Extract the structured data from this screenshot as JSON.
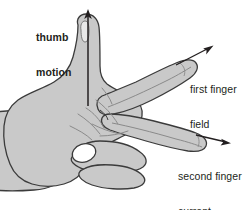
{
  "diagram": {
    "background_color": "#ffffff",
    "hand_fill_color": "#c9c9c9",
    "hand_outline_color": "#3b3b3b",
    "crease_line_color": "#8a8a8a",
    "arrow_color": "#231f20",
    "text_color": "#231f20",
    "labels": {
      "thumb": {
        "line1": "thumb",
        "line2": "motion"
      },
      "first_finger": {
        "line1": "first finger",
        "line2": "field"
      },
      "second_finger": {
        "line1": "second finger",
        "line2": "current"
      }
    },
    "arrows": {
      "thumb_motion": {
        "direction": "up",
        "from_x": 88,
        "from_y": 104,
        "to_x": 88,
        "to_y": 11
      },
      "first_finger_field": {
        "direction": "up-right",
        "from_x": 146,
        "from_y": 90,
        "to_x": 212,
        "to_y": 47
      },
      "second_finger_current": {
        "direction": "down-right",
        "from_x": 170,
        "from_y": 128,
        "to_x": 228,
        "to_y": 143
      }
    }
  }
}
